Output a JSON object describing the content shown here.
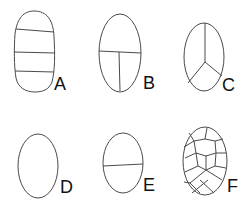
{
  "figure": {
    "type": "cell-division-patterns",
    "stroke_color": "#4a4a4a",
    "label_color": "#111111",
    "panels": [
      {
        "id": "A",
        "label": "A",
        "description": "elongated oval divided by three transverse walls into four cells"
      },
      {
        "id": "B",
        "label": "B",
        "description": "oval with one transverse wall, lower half divided by one longitudinal wall"
      },
      {
        "id": "C",
        "label": "C",
        "description": "oval divided into three cells by walls meeting at a central point (Y junction)"
      },
      {
        "id": "D",
        "label": "D",
        "description": "undivided oval cell"
      },
      {
        "id": "E",
        "label": "E",
        "description": "oval divided by a single transverse wall into two cells"
      },
      {
        "id": "F",
        "label": "F",
        "description": "oval subdivided into many polygonal cells"
      }
    ]
  }
}
